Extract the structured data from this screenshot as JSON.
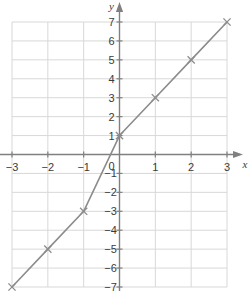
{
  "figure": {
    "kind": "cartesian-coordinate-plane",
    "background_color": "#ffffff",
    "grid_color": "#d8d8d8",
    "axis_color": "#808080",
    "curve_color": "#8c8c8c",
    "marker_color": "#8c8c8c",
    "label_color": "#3b3b3b"
  },
  "axes": {
    "x_axis_label": "x",
    "y_axis_label": "y",
    "x_tick_labels": [
      "-3",
      "-2",
      "-1",
      "0",
      "1",
      "2",
      "3"
    ],
    "y_tick_labels_positive": [
      "7",
      "6",
      "5",
      "4",
      "3",
      "2",
      "1"
    ],
    "y_tick_labels_negative": [
      "-1",
      "-2",
      "-3",
      "-4",
      "-5",
      "-6",
      "-7"
    ],
    "origin_label": "0"
  },
  "chart_data": {
    "type": "line",
    "title": "",
    "xlabel": "x",
    "ylabel": "y",
    "xlim": [
      -3,
      3
    ],
    "ylim": [
      -7,
      7
    ],
    "xticks": [
      -3,
      -2,
      -1,
      0,
      1,
      2,
      3
    ],
    "yticks": [
      -7,
      -6,
      -5,
      -4,
      -3,
      -2,
      -1,
      0,
      1,
      2,
      3,
      4,
      5,
      6,
      7
    ],
    "grid": true,
    "legend": false,
    "marker": "x",
    "series": [
      {
        "name": "piecewise-linear-function",
        "x": [
          -3,
          -2,
          -1,
          0,
          1,
          2,
          3
        ],
        "values": [
          -7,
          -5,
          -3,
          1,
          3,
          5,
          7
        ],
        "points": [
          {
            "x": -3,
            "y": -7
          },
          {
            "x": -2,
            "y": -5
          },
          {
            "x": -1,
            "y": -3
          },
          {
            "x": 0,
            "y": 1
          },
          {
            "x": 1,
            "y": 3
          },
          {
            "x": 2,
            "y": 5
          },
          {
            "x": 3,
            "y": 7
          }
        ]
      }
    ]
  }
}
